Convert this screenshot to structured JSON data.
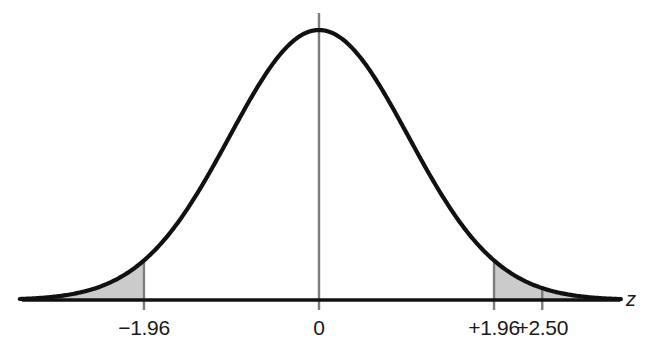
{
  "chart_data": {
    "type": "area",
    "title": "",
    "subtitle": "",
    "xlabel": "z",
    "ylabel": "",
    "grid": false,
    "legend": null,
    "distribution": "standard normal",
    "mean": 0,
    "sd": 1,
    "xlim": [
      -3.35,
      3.38
    ],
    "ylim": [
      0,
      0.42
    ],
    "x_ticks": [
      {
        "value": -1.96,
        "label": "−1.96"
      },
      {
        "value": 0,
        "label": "0"
      },
      {
        "value": 1.96,
        "label": "+1.96"
      },
      {
        "value": 2.5,
        "label": "+2.50"
      }
    ],
    "vertical_lines": [
      {
        "value": -1.96,
        "label": "−1.96",
        "from": "curve"
      },
      {
        "value": 0,
        "label": "0",
        "from": "above-peak"
      },
      {
        "value": 1.96,
        "label": "+1.96",
        "from": "curve"
      },
      {
        "value": 2.5,
        "label": "+2.50",
        "from": "curve"
      }
    ],
    "shaded_regions": [
      {
        "name": "left-tail",
        "from": -3.35,
        "to": -1.96
      },
      {
        "name": "right-tail",
        "from": 1.96,
        "to": 3.35
      }
    ],
    "colors": {
      "curve": "#111111",
      "axis": "#111111",
      "shade": "#cbcbcb",
      "shade_edge": "#b8b8b8",
      "vertical_line": "#7d7d7d",
      "text": "#1a1a1a",
      "background": "#ffffff"
    }
  },
  "axis": {
    "z_label": "z"
  },
  "labels": {
    "neg_196": "−1.96",
    "zero": "0",
    "pos_196": "+1.96",
    "pos_250": "+2.50"
  }
}
